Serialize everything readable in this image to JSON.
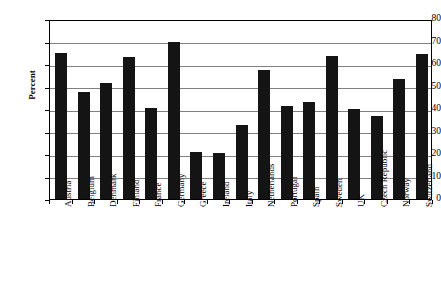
{
  "chart_data": {
    "type": "bar",
    "title": "",
    "subtitle": "",
    "xlabel": "",
    "ylabel": "Percent",
    "ylim": [
      0,
      80
    ],
    "ytick_step": 10,
    "yticks": [
      "0",
      "10",
      "20",
      "30",
      "40",
      "50",
      "60",
      "70",
      "80"
    ],
    "grid": true,
    "legend": false,
    "bar_color": "#141414",
    "grid_color": "#808080",
    "axis_color": "#000000",
    "categories": [
      "Austria",
      "Belgium",
      "Denmark",
      "Finland",
      "France",
      "Germany",
      "Greece",
      "Ireland",
      "Italy",
      "Netherlands",
      "Portugal",
      "Spain",
      "Sweden",
      "UK",
      "Czech Republic",
      "Norway",
      "Switzerland"
    ],
    "values": [
      65,
      47.5,
      51.5,
      63,
      40.5,
      70,
      21,
      20.5,
      33,
      57.5,
      41.5,
      43,
      63.5,
      40,
      37,
      53.5,
      64.5
    ]
  }
}
